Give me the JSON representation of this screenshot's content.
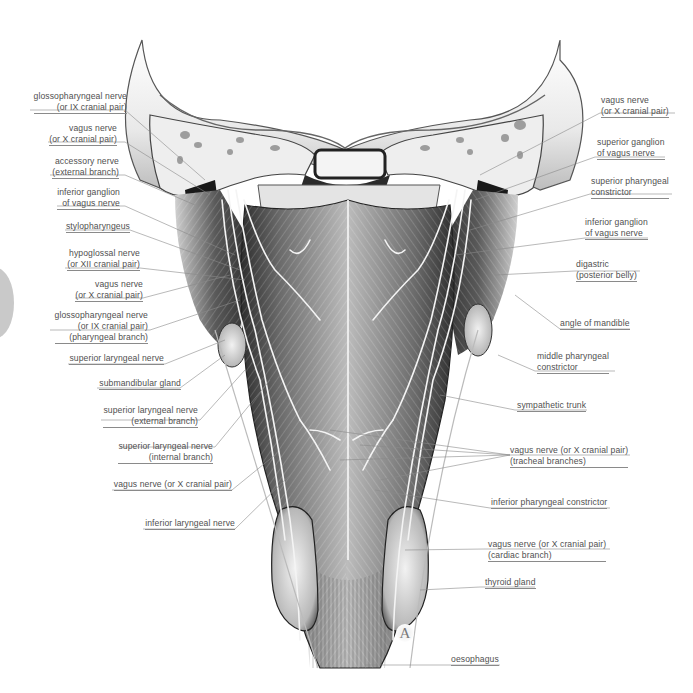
{
  "figure": {
    "plate_letter": "A",
    "labels_left": [
      {
        "id": "glossopharyngeal-nerve",
        "lines": [
          "glossopharyngeal nerve",
          "(or IX cranial pair)"
        ]
      },
      {
        "id": "vagus-nerve-upper-left",
        "lines": [
          "vagus nerve",
          "(or X cranial pair)"
        ]
      },
      {
        "id": "accessory-nerve",
        "lines": [
          "accessory nerve",
          "(external branch)"
        ]
      },
      {
        "id": "inferior-ganglion-left",
        "lines": [
          "inferior ganglion",
          "of vagus nerve"
        ]
      },
      {
        "id": "stylopharyngeus",
        "lines": [
          "stylopharyngeus"
        ]
      },
      {
        "id": "hypoglossal-nerve",
        "lines": [
          "hypoglossal nerve",
          "(or XII cranial pair)"
        ]
      },
      {
        "id": "vagus-nerve-mid-left",
        "lines": [
          "vagus nerve",
          "(or X cranial pair)"
        ]
      },
      {
        "id": "glossopharyngeal-pharyngeal-branch",
        "lines": [
          "glossopharyngeal nerve",
          "(or IX cranial pair)",
          "(pharyngeal branch)"
        ]
      },
      {
        "id": "superior-laryngeal-nerve",
        "lines": [
          "superior laryngeal nerve"
        ]
      },
      {
        "id": "submandibular-gland",
        "lines": [
          "submandibular gland"
        ]
      },
      {
        "id": "superior-laryngeal-external",
        "lines": [
          "superior laryngeal nerve",
          "(external branch)"
        ]
      },
      {
        "id": "superior-laryngeal-internal",
        "lines": [
          "superior laryngeal nerve",
          "(internal branch)"
        ]
      },
      {
        "id": "vagus-nerve-lower-left",
        "lines": [
          "vagus nerve (or X cranial pair)"
        ]
      },
      {
        "id": "inferior-laryngeal-nerve",
        "lines": [
          "inferior laryngeal nerve"
        ]
      }
    ],
    "labels_right": [
      {
        "id": "vagus-nerve-upper-right",
        "lines": [
          "vagus nerve",
          "(or X cranial pair)"
        ]
      },
      {
        "id": "superior-ganglion",
        "lines": [
          "superior ganglion",
          "of vagus nerve"
        ]
      },
      {
        "id": "superior-pharyngeal-constrictor",
        "lines": [
          "superior pharyngeal",
          "constrictor"
        ]
      },
      {
        "id": "inferior-ganglion-right",
        "lines": [
          "inferior ganglion",
          "of vagus nerve"
        ]
      },
      {
        "id": "digastric",
        "lines": [
          "digastric",
          "(posterior belly)"
        ]
      },
      {
        "id": "angle-of-mandible",
        "lines": [
          "angle of mandible"
        ]
      },
      {
        "id": "middle-pharyngeal-constrictor",
        "lines": [
          "middle pharyngeal",
          "constrictor"
        ]
      },
      {
        "id": "sympathetic-trunk",
        "lines": [
          "sympathetic trunk"
        ]
      },
      {
        "id": "vagus-tracheal-branches",
        "lines": [
          "vagus nerve (or X cranial pair)",
          "(tracheal branches)"
        ]
      },
      {
        "id": "inferior-pharyngeal-constrictor",
        "lines": [
          "inferior pharyngeal constrictor"
        ]
      },
      {
        "id": "vagus-cardiac-branch",
        "lines": [
          "vagus nerve (or X cranial pair)",
          "(cardiac branch)"
        ]
      },
      {
        "id": "thyroid-gland",
        "lines": [
          "thyroid gland"
        ]
      },
      {
        "id": "oesophagus",
        "lines": [
          "oesophagus"
        ]
      }
    ]
  },
  "colors": {
    "label_text": "#505050",
    "leader_line": "#8a8a8a",
    "muscle_dark": "#3a3a3a",
    "muscle_mid": "#8c8c8c",
    "bone": "#e6e6e6",
    "nerve": "#f2f2f2"
  }
}
